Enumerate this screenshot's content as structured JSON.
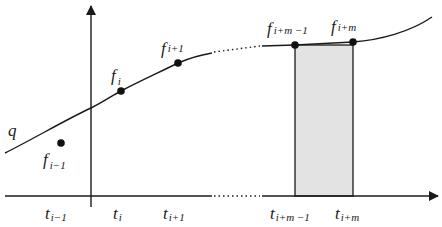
{
  "diagram": {
    "type": "function-sampling-diagram",
    "curve_label": "q",
    "axes": {
      "x_axis": {
        "has_arrow": true,
        "dotted_gap": true
      },
      "y_axis": {
        "has_arrow": true
      }
    },
    "points": [
      {
        "id": "f_im1",
        "base": "f",
        "sub": "i−1",
        "on_curve": false
      },
      {
        "id": "f_i",
        "base": "f",
        "sub": "i",
        "on_curve": true
      },
      {
        "id": "f_ip1",
        "base": "f",
        "sub": "i+1",
        "on_curve": true
      },
      {
        "id": "f_ipm_m1",
        "base": "f",
        "sub": "i+m −1",
        "on_curve": true
      },
      {
        "id": "f_ipm",
        "base": "f",
        "sub": "i+m",
        "on_curve": true
      }
    ],
    "ticks": [
      {
        "id": "t_im1",
        "base": "t",
        "sub": "i−1"
      },
      {
        "id": "t_i",
        "base": "t",
        "sub": "i"
      },
      {
        "id": "t_ip1",
        "base": "t",
        "sub": "i+1"
      },
      {
        "id": "t_ipm_m1",
        "base": "t",
        "sub": "i+m −1"
      },
      {
        "id": "t_ipm",
        "base": "t",
        "sub": "i+m"
      }
    ],
    "shaded_interval": {
      "from": "t_{i+m-1}",
      "to": "t_{i+m}",
      "fill": "#e3e3e3"
    },
    "colors": {
      "stroke": "#1a1a1a",
      "shade": "#e3e3e3",
      "background": "#ffffff"
    }
  }
}
